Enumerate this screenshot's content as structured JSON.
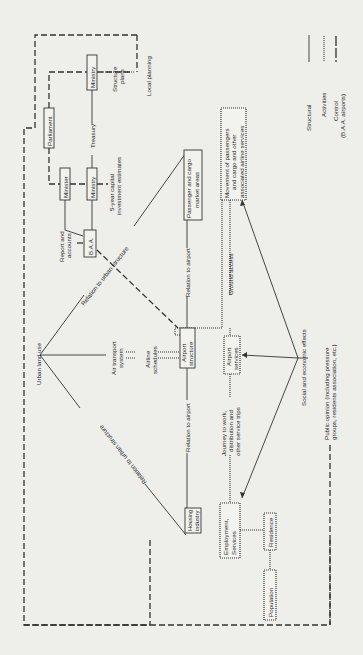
{
  "diagram": {
    "orientation": "rotated -90 degrees (text reads bottom-to-top)",
    "nodes": {
      "parliament": "Parliament",
      "ministry_top": "Ministry",
      "minister": "Minister",
      "ministry_mid": "Ministry",
      "baa": "B.A.A.",
      "urban_land_use": "Urban land use",
      "air_transport_system_1": "Air transport",
      "air_transport_system_2": "system",
      "airline_schedules_1": "Airline",
      "airline_schedules_2": "schedules",
      "airport_structure_1": "Airport",
      "airport_structure_2": "structure",
      "passenger_cargo_1": "Passenger and cargo",
      "passenger_cargo_2": "market areas",
      "movement_1": "Movement of passengers",
      "movement_2": "and cargo and other",
      "movement_3": "associated airline services",
      "airport_services_1": "Airport",
      "airport_services_2": "services",
      "housing_industry_1": "Housing",
      "housing_industry_2": "industry",
      "employment_services_1": "Employment,",
      "employment_services_2": "Services",
      "residence": "Residence",
      "population": "Population"
    },
    "edge_labels": {
      "structure_plans_1": "Structure",
      "structure_plans_2": "plans",
      "local_planning": "Local planning",
      "treasury": "Treasury",
      "capital_estimates_1": "5-year capital",
      "capital_estimates_2": "investment estimates",
      "report_accounts_1": "Report and",
      "report_accounts_2": "accounts",
      "relation_urban_upper": "Relation to urban structure",
      "relation_urban_lower": "Relation to urban structure",
      "relation_airport_upper": "Relation to airport",
      "relation_airport_lower": "Relation to airport",
      "ground_access": "Ground access",
      "journey_1": "Journey to work,",
      "journey_2": "distribution and",
      "journey_3": "other service trips",
      "social_economic": "Social and economic effects",
      "public_opinion_1": "Public opinion (including pressure",
      "public_opinion_2": "groups, residents association, etc.)"
    },
    "legend": {
      "structural": "Structural",
      "activities": "Activities",
      "control_1": "Control",
      "control_2": "(B.A.A. airports)"
    },
    "colors": {
      "background": "#eeeeea",
      "ink": "#333333"
    }
  }
}
